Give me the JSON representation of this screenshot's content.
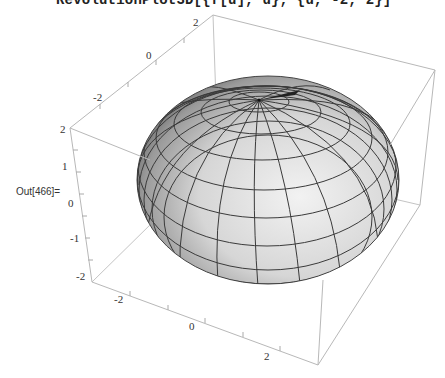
{
  "notebook": {
    "input_code": "RevolutionPlot3D[{f[u], u}, {u, -2, 2}]",
    "output_label": "Out[466]="
  },
  "plot": {
    "type": "3d-surface",
    "surface": "ellipsoid of revolution",
    "surface_color": "#cfcfcf",
    "mesh_color": "#333333",
    "box_color": "#bdbdbd",
    "axes": {
      "top_back_ticks": [
        "0",
        "-2"
      ],
      "vertical_ticks": [
        "2",
        "1",
        "0",
        "-1",
        "-2"
      ],
      "bottom_front_ticks": [
        "-2",
        "0",
        "2"
      ],
      "top_left_corner_tick": "2"
    }
  }
}
